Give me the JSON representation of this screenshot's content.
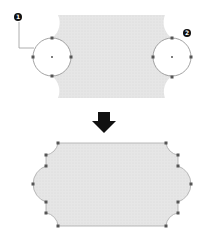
{
  "diagram": {
    "colors": {
      "shape_fill": "#e4e4e4",
      "shape_stroke": "#b8b8b8",
      "circle_stroke": "#8a8a8a",
      "point_fill": "#555555",
      "badge_fill": "#111111",
      "arrow_fill": "#111111",
      "leader_line": "#9a9a9a"
    },
    "before": {
      "label": "Shape with circle guides",
      "circles": [
        {
          "id": 1,
          "cx": 52,
          "cy": 57,
          "r": 19
        },
        {
          "id": 2,
          "cx": 172,
          "cy": 57,
          "r": 19
        }
      ]
    },
    "callouts": [
      {
        "number": "1",
        "x": 18,
        "y": 16
      },
      {
        "number": "2",
        "x": 187,
        "y": 32
      }
    ],
    "arrow": {
      "direction": "down"
    },
    "after": {
      "label": "Resulting shape with scalloped ends"
    }
  }
}
